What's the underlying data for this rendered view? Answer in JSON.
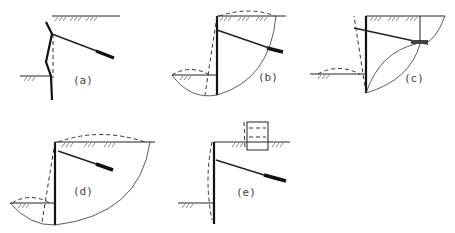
{
  "figure": {
    "panels": [
      {
        "id": "a",
        "label": "(a)",
        "mode": "Wall bending / flexural failure"
      },
      {
        "id": "b",
        "label": "(b)",
        "mode": "Overall deep-seated slip below wall toe, anchor within slip mass"
      },
      {
        "id": "c",
        "label": "(c)",
        "mode": "Wall rotation about toe with anchor pull-out wedge"
      },
      {
        "id": "d",
        "label": "(d)",
        "mode": "Global slip circle encompassing anchor"
      },
      {
        "id": "e",
        "label": "(e)",
        "mode": "Wall deflection under surcharge load"
      }
    ]
  }
}
